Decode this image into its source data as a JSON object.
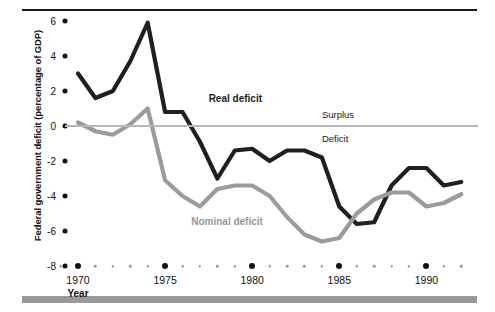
{
  "figure": {
    "y_axis_title": "Federal government deficit (percentage of GDP)",
    "x_axis_title": "Year",
    "annotation_surplus": "Surplus",
    "annotation_deficit": "Deficit",
    "label_real": "Real deficit",
    "label_nominal": "Nominal deficit",
    "colors": {
      "real_line": "#1f1f1f",
      "nominal_line": "#9b9b9b",
      "zero_line": "#b7b7b7",
      "rule_top": "#1a1a1a",
      "rule_bottom": "#9a9a9a",
      "text": "#111111"
    }
  },
  "chart_data": {
    "type": "line",
    "title": "",
    "subtitle": "",
    "xlabel": "Year",
    "ylabel": "Federal government deficit (percentage of GDP)",
    "xlim": [
      1969,
      1992
    ],
    "ylim": [
      -8,
      6
    ],
    "grid": false,
    "legend": "inline-annotations",
    "y_ticks": [
      6,
      4,
      2,
      0,
      -2,
      -4,
      -6,
      -8
    ],
    "y_tick_labels": [
      "6",
      "4",
      "2",
      "0",
      "-2",
      "-4",
      "-6",
      "-8"
    ],
    "x_ticks": [
      1970,
      1975,
      1980,
      1985,
      1990
    ],
    "x_tick_labels": [
      "1970",
      "1975",
      "1980",
      "1985",
      "1990"
    ],
    "x_minor_ticks": [
      1969,
      1971,
      1972,
      1973,
      1974,
      1976,
      1977,
      1978,
      1979,
      1981,
      1982,
      1983,
      1984,
      1986,
      1987,
      1988,
      1989,
      1991,
      1992
    ],
    "annotations": [
      {
        "text": "Surplus",
        "x": 1984,
        "y": 0.55
      },
      {
        "text": "Deficit",
        "x": 1984,
        "y": -0.75
      },
      {
        "text": "Real deficit",
        "x": 1977.5,
        "y": 1.5
      },
      {
        "text": "Nominal deficit",
        "x": 1976.5,
        "y": -5.55
      }
    ],
    "x": [
      1970,
      1971,
      1972,
      1973,
      1974,
      1975,
      1976,
      1977,
      1978,
      1979,
      1980,
      1981,
      1982,
      1983,
      1984,
      1985,
      1986,
      1987,
      1988,
      1989,
      1990,
      1991,
      1992
    ],
    "series": [
      {
        "name": "Real deficit",
        "color": "#1f1f1f",
        "values": [
          3.0,
          1.6,
          2.0,
          3.7,
          5.9,
          0.8,
          0.8,
          -0.9,
          -3.0,
          -1.4,
          -1.3,
          -2.0,
          -1.4,
          -1.4,
          -1.8,
          -4.6,
          -5.6,
          -5.5,
          -3.4,
          -2.4,
          -2.4,
          -3.4,
          -3.2
        ]
      },
      {
        "name": "Nominal deficit",
        "color": "#9b9b9b",
        "values": [
          0.2,
          -0.3,
          -0.5,
          0.1,
          1.0,
          -3.1,
          -4.0,
          -4.6,
          -3.6,
          -3.4,
          -3.4,
          -4.0,
          -5.2,
          -6.2,
          -6.6,
          -6.4,
          -5.0,
          -4.2,
          -3.8,
          -3.8,
          -4.6,
          -4.4,
          -3.9
        ]
      }
    ]
  }
}
